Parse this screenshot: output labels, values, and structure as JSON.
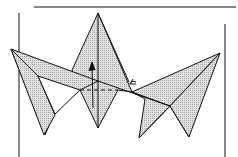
{
  "diagram": {
    "type": "origami-fold-diagram",
    "colors": {
      "fill": "#cfcfcf",
      "stroke": "#111111",
      "background": "#ffffff"
    },
    "annotations": [
      {
        "kind": "arrow",
        "direction": "up",
        "meaning": "fold up"
      },
      {
        "kind": "dashed-line",
        "meaning": "fold line"
      },
      {
        "kind": "arrow",
        "direction": "curved-left",
        "meaning": "fold direction"
      }
    ]
  }
}
